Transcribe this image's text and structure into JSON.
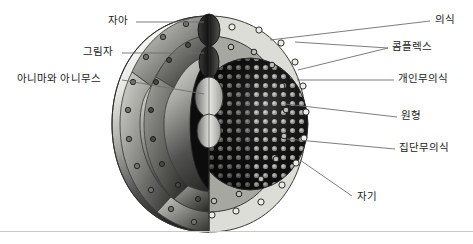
{
  "diagram": {
    "type": "cutaway-sphere-layers",
    "palette": {
      "consciousness_ring": "#d9d9d3",
      "personal_unconscious_ring": "#a8a8a2",
      "collective_unconscious_core": "#141414",
      "sphere_light": "#f2f2f0",
      "sphere_dark": "#2b2b2b",
      "outline": "#3a3a3a",
      "leader_line": "#6e6e6e",
      "text": "#1b1b1b",
      "footer_rule": "#c9c9c9"
    },
    "labels_left": [
      {
        "id": "ego",
        "text": "자아",
        "x": 108,
        "y": 18
      },
      {
        "id": "shadow",
        "text": "그림자",
        "x": 83,
        "y": 49
      },
      {
        "id": "anima-animus",
        "text": "아니마와 아니무스",
        "x": 17,
        "y": 76
      }
    ],
    "labels_right": [
      {
        "id": "consciousness",
        "text": "의식",
        "x": 435,
        "y": 17
      },
      {
        "id": "complex",
        "text": "콤플렉스",
        "x": 392,
        "y": 44
      },
      {
        "id": "personal-unconscious",
        "text": "개인무의식",
        "x": 398,
        "y": 76
      },
      {
        "id": "archetype",
        "text": "원형",
        "x": 401,
        "y": 113
      },
      {
        "id": "collective-unconscious",
        "text": "집단무의식",
        "x": 399,
        "y": 145
      },
      {
        "id": "self",
        "text": "자기",
        "x": 357,
        "y": 194
      }
    ]
  }
}
